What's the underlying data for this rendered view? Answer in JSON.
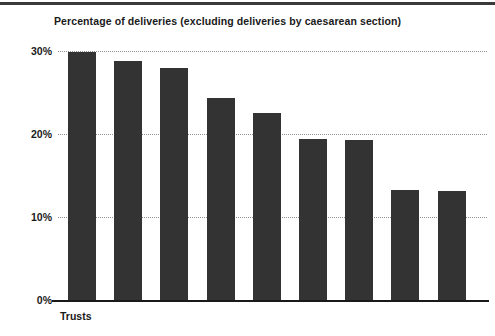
{
  "chart_data": {
    "type": "bar",
    "title": "Percentage of deliveries (excluding deliveries by caesarean section)",
    "xlabel": "Trusts",
    "ylabel": "",
    "ylim": [
      0,
      30
    ],
    "ytick_labels": [
      "0%",
      "10%",
      "20%",
      "30%"
    ],
    "ytick_values": [
      0,
      10,
      20,
      30
    ],
    "grid": true,
    "legend": null,
    "categories": [
      "",
      "",
      "",
      "",
      "",
      "",
      "",
      "",
      ""
    ],
    "values": [
      29.9,
      28.8,
      27.9,
      24.3,
      22.5,
      19.4,
      19.3,
      13.3,
      13.1
    ],
    "series": [
      {
        "name": "Percentage of deliveries",
        "values": [
          29.9,
          28.8,
          27.9,
          24.3,
          22.5,
          19.4,
          19.3,
          13.3,
          13.1
        ]
      }
    ],
    "bar_color": "#333333",
    "grid_color": "#8f8f8f",
    "axis_color": "#1a1a1a"
  }
}
